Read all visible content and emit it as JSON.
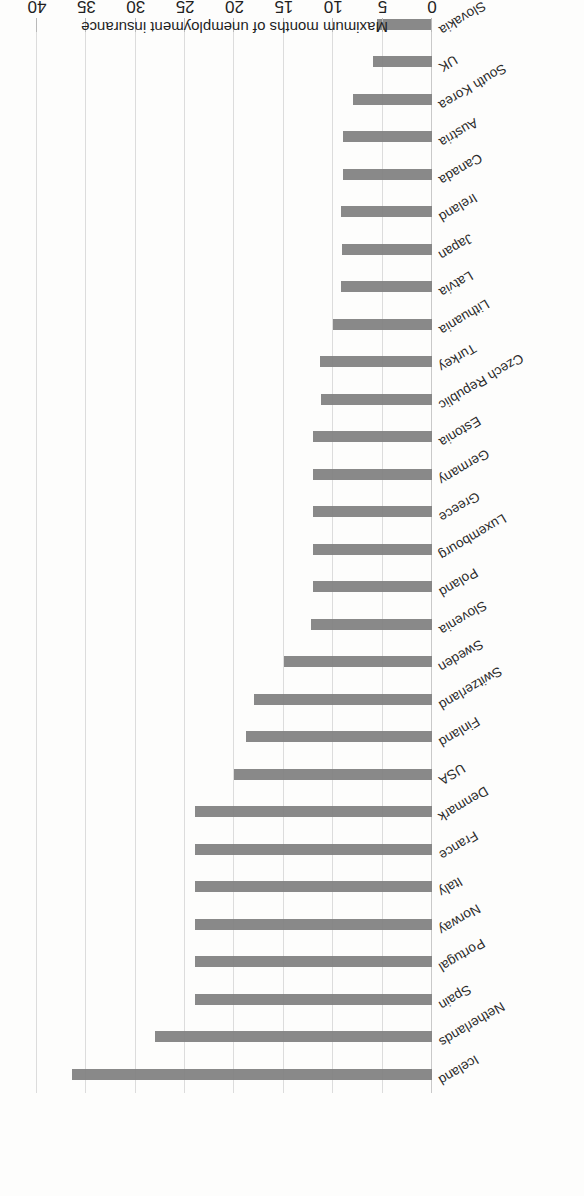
{
  "chart_data": {
    "type": "bar",
    "orientation": "horizontal",
    "title": "",
    "xlabel": "Maximum months of unemployment insurance",
    "ylabel": "",
    "xlim": [
      0,
      40
    ],
    "xticks": [
      "0",
      "5",
      "10",
      "15",
      "20",
      "25",
      "30",
      "35",
      "40"
    ],
    "grid": true,
    "legend": "none",
    "bar_color": "#7f7f7f",
    "gridline_color": "#dcdcdc",
    "background_color": "#fdfdfc",
    "categories": [
      "Iceland",
      "Netherlands",
      "Spain",
      "Portugal",
      "Norway",
      "Italy",
      "France",
      "Denmark",
      "USA",
      "Finland",
      "Switzerland",
      "Sweden",
      "Slovenia",
      "Poland",
      "Luxembourg",
      "Greece",
      "Germany",
      "Estonia",
      "Czech Republic",
      "Turkey",
      "Lithuania",
      "Latvia",
      "Japan",
      "Ireland",
      "Canada",
      "Austria",
      "South Korea",
      "UK",
      "Slovakia"
    ],
    "values": [
      36.5,
      28,
      24,
      24,
      24,
      24,
      24,
      24,
      20,
      18.8,
      18,
      15,
      12.3,
      12,
      12,
      12,
      12,
      12,
      11.2,
      11.3,
      10,
      9.2,
      9.1,
      9.2,
      9,
      9,
      8,
      6,
      5.6
    ]
  }
}
